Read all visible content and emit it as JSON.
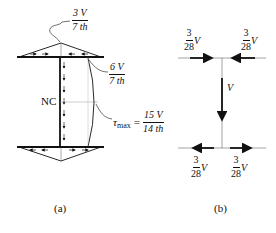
{
  "panel_a": {
    "caption": "(a)",
    "top_flange_label": {
      "num": "3 V",
      "den": "7 th"
    },
    "web_top_label": {
      "num": "6 V",
      "den": "7 th"
    },
    "neutral_axis_label": "NC",
    "tau_max_label": {
      "symbol": "τ",
      "subscript": "max",
      "equals": "=",
      "num": "15 V",
      "den": "14 th"
    }
  },
  "panel_b": {
    "caption": "(b)",
    "top_left_force": {
      "num": "3",
      "den": "28",
      "var": "V"
    },
    "top_right_force": {
      "num": "3",
      "den": "28",
      "var": "V"
    },
    "web_force": "V",
    "bottom_left_force": {
      "num": "3",
      "den": "28",
      "var": "V"
    },
    "bottom_right_force": {
      "num": "3",
      "den": "28",
      "var": "V"
    }
  }
}
